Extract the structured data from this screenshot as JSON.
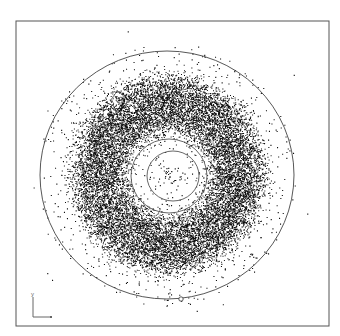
{
  "figure": {
    "width": 340,
    "height": 336,
    "background": "#ffffff",
    "frame": {
      "x": 16,
      "y": 21,
      "width": 313,
      "height": 305,
      "stroke": "#555555"
    }
  },
  "chart_data": {
    "type": "scatter",
    "title": "",
    "xlabel": "x",
    "ylabel": "y",
    "grid": false,
    "legend": null,
    "center": [
      168,
      174
    ],
    "point_color": "#111111",
    "distributions": [
      {
        "name": "dense-ring",
        "count": 16000,
        "r_inner": 46,
        "r_outer": 92,
        "r_soft": 7,
        "dot": 1.0
      },
      {
        "name": "inner-sparse",
        "count": 140,
        "r_inner": 0,
        "r_outer": 48,
        "dot": 1.1
      },
      {
        "name": "outer-sparse",
        "count": 520,
        "r_inner": 88,
        "r_outer": 130,
        "dot": 1.1
      },
      {
        "name": "far-outliers",
        "count": 12,
        "r_inner": 128,
        "r_outer": 160,
        "dot": 1.1
      }
    ],
    "circles": [
      {
        "name": "outer-boundary-circle",
        "cx": 167,
        "cy": 175,
        "rx": 127,
        "ry": 124,
        "stroke": "#444444",
        "width": 0.9
      },
      {
        "name": "middle-reference-circle",
        "cx": 169,
        "cy": 176,
        "rx": 38,
        "ry": 37,
        "stroke": "#555555",
        "width": 0.9
      },
      {
        "name": "inner-reference-circle",
        "cx": 173,
        "cy": 176,
        "rx": 26,
        "ry": 25,
        "stroke": "#555555",
        "width": 0.9
      }
    ],
    "markers": [
      {
        "name": "open-circle-marker",
        "cx": 181,
        "cy": 299,
        "r": 2.2
      }
    ],
    "axis_indicator": {
      "origin": [
        33,
        317
      ],
      "length_x": 18,
      "length_y": 20,
      "x_label": "x",
      "y_label": "y",
      "stroke": "#666666"
    },
    "seed": 12345
  }
}
